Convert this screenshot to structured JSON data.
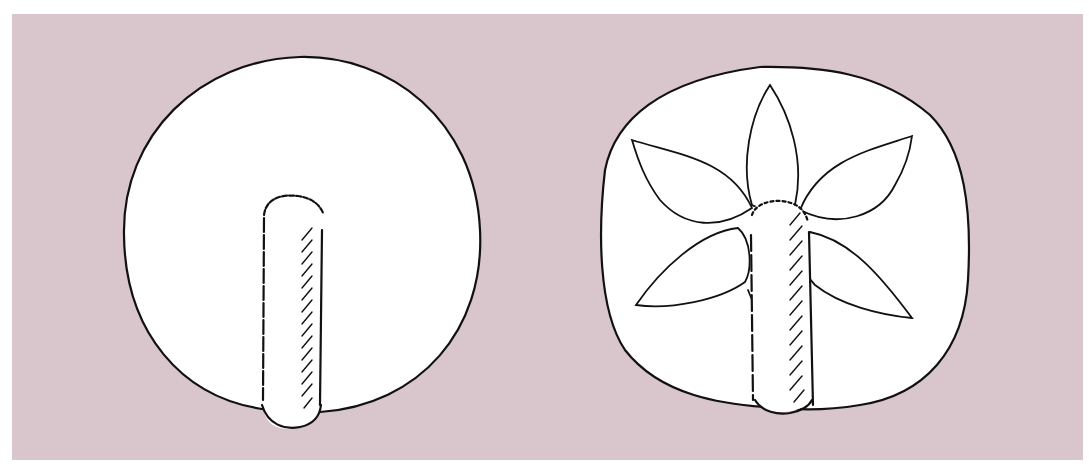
{
  "figure": {
    "background_color": "#d9c5cc",
    "panel_fill": "#ffffff",
    "line_color": "#111111",
    "left_object": {
      "name": "plain-round-seal",
      "shape": "circle",
      "has_handle": true,
      "decoration": "none"
    },
    "right_object": {
      "name": "flower-seal",
      "shape": "rounded-square",
      "has_handle": true,
      "decoration": "six-petal flower",
      "petal_count": 6
    }
  }
}
